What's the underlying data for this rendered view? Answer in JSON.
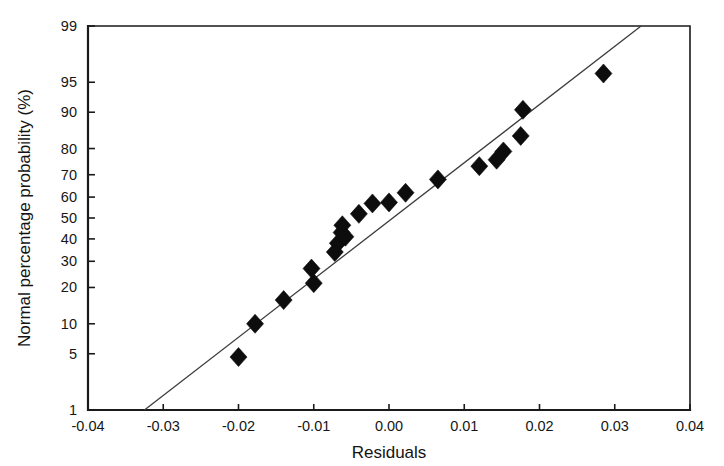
{
  "chart_data": {
    "type": "scatter",
    "title": "",
    "subtitle": "",
    "xlabel": "Residuals",
    "ylabel": "Normal percentage probability (%)",
    "xlim": [
      -0.04,
      0.04
    ],
    "ylim": [
      1,
      99
    ],
    "yscale": "normal-probability",
    "grid": false,
    "legend": null,
    "xticks": [
      -0.04,
      -0.03,
      -0.02,
      -0.01,
      0.0,
      0.01,
      0.02,
      0.03,
      0.04
    ],
    "xtick_labels": [
      "-0.04",
      "-0.03",
      "-0.02",
      "-0.01",
      "0.00",
      "0.01",
      "0.02",
      "0.03",
      "0.04"
    ],
    "yticks": [
      1,
      5,
      10,
      20,
      30,
      40,
      50,
      60,
      70,
      80,
      90,
      95,
      99
    ],
    "ytick_labels": [
      "1",
      "5",
      "10",
      "20",
      "30",
      "40",
      "50",
      "60",
      "70",
      "80",
      "90",
      "95",
      "99"
    ],
    "series": [
      {
        "name": "residual-points",
        "marker": "diamond",
        "color": "#0d0d0d",
        "x": [
          -0.02,
          -0.0178,
          -0.014,
          -0.0103,
          -0.01,
          -0.0072,
          -0.0068,
          -0.0063,
          -0.0062,
          -0.0058,
          -0.004,
          -0.0022,
          0.0,
          0.0022,
          0.0065,
          0.012,
          0.0143,
          0.0152,
          0.0175,
          0.0178,
          0.0285
        ],
        "y": [
          4.6,
          10.0,
          16.0,
          27.0,
          21.5,
          34.0,
          38.0,
          43.0,
          46.5,
          41.0,
          52.0,
          57.0,
          57.5,
          62.0,
          68.0,
          73.5,
          76.0,
          79.0,
          84.0,
          90.5,
          96.0
        ]
      }
    ],
    "reference_line": {
      "name": "normal-reference-line",
      "color": "#3c3c3c",
      "x": [
        -0.0325,
        0.0335
      ],
      "y": [
        1,
        99
      ]
    }
  },
  "axes": {
    "x_title": "Residuals",
    "y_title": "Normal percentage probability (%)"
  }
}
